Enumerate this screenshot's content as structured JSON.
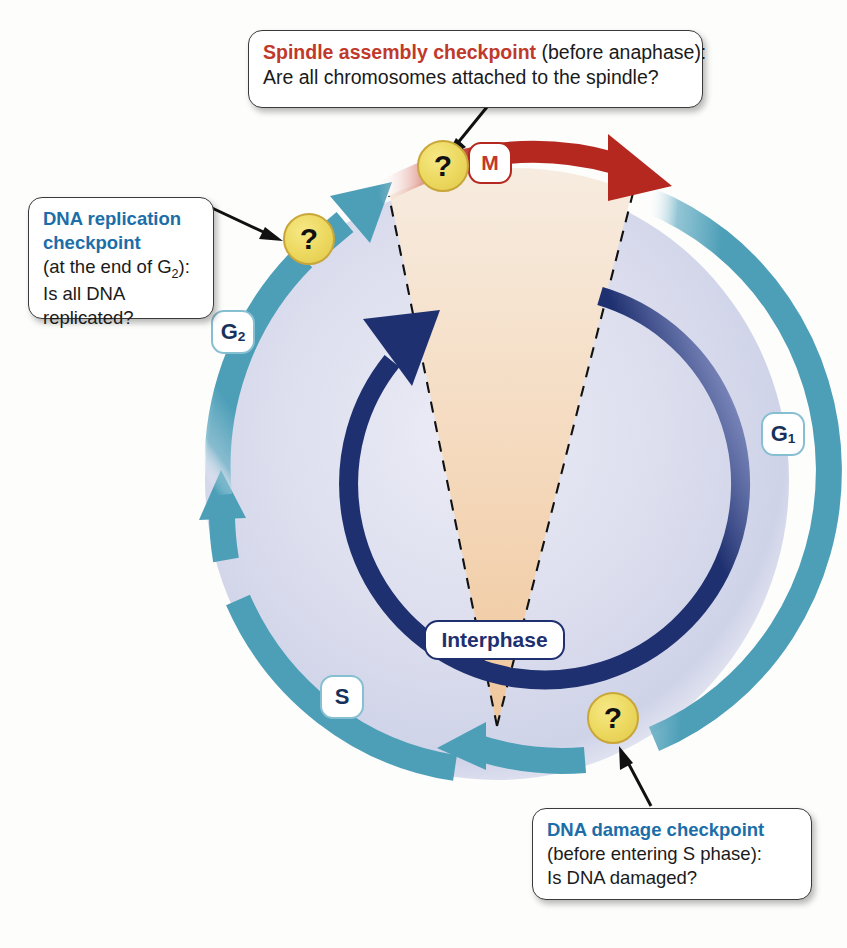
{
  "figure": {
    "colors": {
      "red_accent": "#c0392b",
      "blue_accent": "#1b6ea8",
      "ring_teal": "#4d9fb8",
      "interphase_navy": "#1f3070",
      "mitosis_red": "#b5281f",
      "checkpoint_yellow": "#ecd85e",
      "wedge_tan": "#f2ceaa",
      "disc_lavender": "#d7d9ec"
    }
  },
  "callouts": [
    {
      "id": "spindle",
      "heading": "Spindle assembly checkpoint",
      "qualifier": " (before anaphase):",
      "question": "Are all chromosomes attached to the spindle?",
      "heading_color": "red"
    },
    {
      "id": "replication",
      "heading_line1": "DNA replication",
      "heading_line2": "checkpoint",
      "qualifier_pre": "(at the end of G",
      "qualifier_sub": "2",
      "qualifier_post": "):",
      "question_line1": "Is all DNA",
      "question_line2": "replicated?",
      "heading_color": "blue"
    },
    {
      "id": "damage",
      "heading": "DNA damage checkpoint",
      "qualifier": "(before entering S phase):",
      "question": "Is DNA damaged?",
      "heading_color": "blue"
    }
  ],
  "phases": [
    {
      "id": "g1",
      "label": "G",
      "sub": "1",
      "name": "Gap 1"
    },
    {
      "id": "s",
      "label": "S",
      "sub": "",
      "name": "Synthesis"
    },
    {
      "id": "g2",
      "label": "G",
      "sub": "2",
      "name": "Gap 2"
    },
    {
      "id": "m",
      "label": "M",
      "sub": "",
      "name": "Mitosis"
    }
  ],
  "interphase": {
    "label": "Interphase"
  },
  "checkpoints": [
    {
      "id": "spindle",
      "glyph": "?",
      "position": "top"
    },
    {
      "id": "replication",
      "glyph": "?",
      "position": "upper-left"
    },
    {
      "id": "damage",
      "glyph": "?",
      "position": "lower-right"
    }
  ]
}
